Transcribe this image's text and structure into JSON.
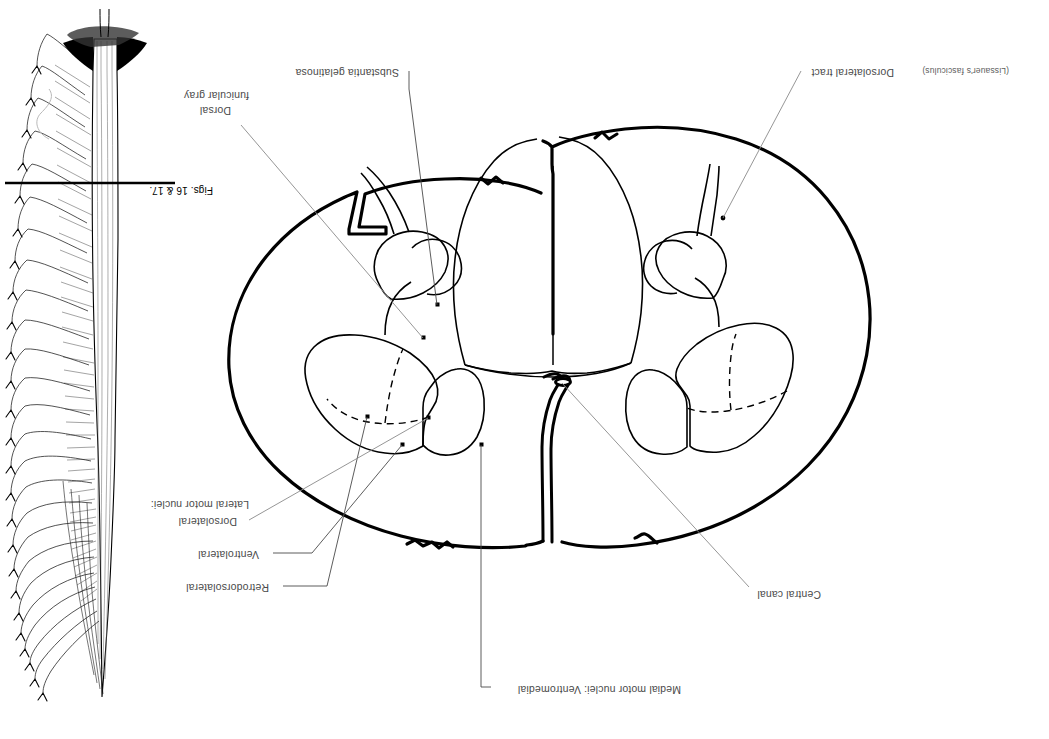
{
  "figure": {
    "type": "anatomical-line-drawing",
    "orientation": "page-rotated-180",
    "background_color": "#ffffff",
    "ink_color": "#000000",
    "leader_color": "#8a8a8a",
    "label_color": "#4a4a4a"
  },
  "labels": {
    "medial_motor": "Medial motor nuclei: Ventromedial",
    "central_canal": "Central canal",
    "retrodorsolateral": "Retrodorsolateral",
    "ventrolateral": "Ventrolateral",
    "dorsolateral": "Dorsolateral",
    "lateral_motor": "Lateral motor nuclei:",
    "dorsolateral_tract": "Dorsolateral tract",
    "dorsolateral_tract_paren": "(Lissauer's fasciculus)",
    "substantia_gelatinosa": "Substantia gelatinosa",
    "dorsal_funicular_gray_1": "Dorsal",
    "dorsal_funicular_gray_2": "funicular gray",
    "figs_reference": "Figs. 16 & 17."
  }
}
